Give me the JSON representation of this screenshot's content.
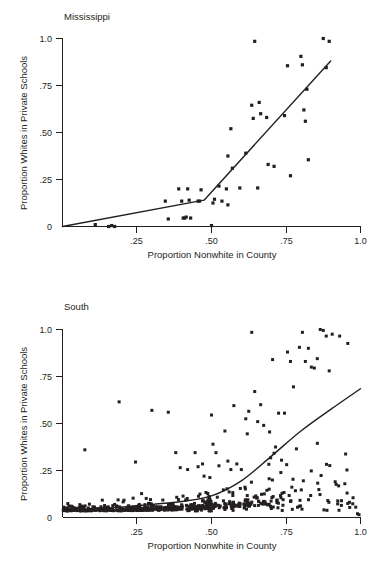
{
  "figure": {
    "panels": [
      {
        "id": "mississippi",
        "title": "Mississippi",
        "xlabel": "Proportion Nonwhite in County",
        "ylabel": "Proportion  Whites in Private Schools",
        "xticklabels": [
          "",
          ".25",
          ".50",
          ".75",
          "1.0"
        ],
        "yticklabels": [
          "0",
          ".25",
          ".50",
          ".75",
          "1.0"
        ]
      },
      {
        "id": "south",
        "title": "South",
        "xlabel": "Proportion Nonwhite in County",
        "ylabel": "Proportion  Whites in Private Schools",
        "xticklabels": [
          "",
          ".25",
          ".50",
          ".75",
          "1.0"
        ],
        "yticklabels": [
          "0",
          ".25",
          ".50",
          ".75",
          "1.0"
        ]
      }
    ]
  },
  "chart_data": [
    {
      "type": "scatter",
      "title": "Mississippi",
      "xlabel": "Proportion Nonwhite in County",
      "ylabel": "Proportion  Whites in Private Schools",
      "xlim": [
        0,
        1.0
      ],
      "ylim": [
        0,
        1.0
      ],
      "xticks": [
        0,
        0.25,
        0.5,
        0.75,
        1.0
      ],
      "yticks": [
        0,
        0.25,
        0.5,
        0.75,
        1.0
      ],
      "xticklabels": [
        "",
        ".25",
        ".50",
        ".75",
        "1.0"
      ],
      "yticklabels": [
        "0",
        ".25",
        ".50",
        ".75",
        "1.0"
      ],
      "grid": false,
      "legend": "none",
      "marker_color": "#231f20",
      "marker_size": 1.6,
      "points": [
        [
          0.11,
          0.01
        ],
        [
          0.155,
          0.0
        ],
        [
          0.165,
          0.005
        ],
        [
          0.175,
          0.0
        ],
        [
          0.345,
          0.135
        ],
        [
          0.355,
          0.04
        ],
        [
          0.39,
          0.2
        ],
        [
          0.4,
          0.135
        ],
        [
          0.405,
          0.045
        ],
        [
          0.41,
          0.045
        ],
        [
          0.415,
          0.05
        ],
        [
          0.42,
          0.2
        ],
        [
          0.425,
          0.14
        ],
        [
          0.43,
          0.045
        ],
        [
          0.455,
          0.135
        ],
        [
          0.46,
          0.135
        ],
        [
          0.465,
          0.195
        ],
        [
          0.5,
          0.005
        ],
        [
          0.505,
          0.125
        ],
        [
          0.51,
          0.145
        ],
        [
          0.525,
          0.215
        ],
        [
          0.535,
          0.135
        ],
        [
          0.55,
          0.2
        ],
        [
          0.555,
          0.375
        ],
        [
          0.555,
          0.115
        ],
        [
          0.565,
          0.52
        ],
        [
          0.57,
          0.31
        ],
        [
          0.595,
          0.205
        ],
        [
          0.615,
          0.39
        ],
        [
          0.635,
          0.645
        ],
        [
          0.64,
          0.575
        ],
        [
          0.645,
          0.985
        ],
        [
          0.655,
          0.205
        ],
        [
          0.66,
          0.66
        ],
        [
          0.665,
          0.6
        ],
        [
          0.685,
          0.58
        ],
        [
          0.69,
          0.33
        ],
        [
          0.71,
          0.32
        ],
        [
          0.745,
          0.59
        ],
        [
          0.755,
          0.855
        ],
        [
          0.765,
          0.27
        ],
        [
          0.8,
          0.905
        ],
        [
          0.805,
          0.86
        ],
        [
          0.81,
          0.62
        ],
        [
          0.815,
          0.56
        ],
        [
          0.82,
          0.73
        ],
        [
          0.825,
          0.355
        ],
        [
          0.875,
          1.0
        ],
        [
          0.885,
          0.845
        ],
        [
          0.895,
          0.985
        ]
      ],
      "fit_line": {
        "kind": "piecewise-linear",
        "vertices": [
          [
            0.0,
            0.0
          ],
          [
            0.475,
            0.14
          ],
          [
            0.9,
            0.88
          ]
        ]
      }
    },
    {
      "type": "scatter",
      "title": "South",
      "xlabel": "Proportion Nonwhite in County",
      "ylabel": "Proportion  Whites in Private Schools",
      "xlim": [
        0,
        1.0
      ],
      "ylim": [
        0,
        1.0
      ],
      "xticks": [
        0,
        0.25,
        0.5,
        0.75,
        1.0
      ],
      "yticks": [
        0,
        0.25,
        0.5,
        0.75,
        1.0
      ],
      "xticklabels": [
        "",
        ".25",
        ".50",
        ".75",
        "1.0"
      ],
      "yticklabels": [
        "0",
        ".25",
        ".50",
        ".75",
        "1.0"
      ],
      "grid": false,
      "legend": "none",
      "marker_color": "#231f20",
      "marker_size": 1.5,
      "n_points": 600,
      "point_seed": 20240517,
      "density_note": "dense band of near-zero values for x<0.5; spread increases with x",
      "points": [
        [
          0.075,
          0.36
        ],
        [
          0.19,
          0.615
        ],
        [
          0.245,
          0.295
        ],
        [
          0.3,
          0.57
        ],
        [
          0.355,
          0.56
        ],
        [
          0.38,
          0.345
        ],
        [
          0.395,
          0.265
        ],
        [
          0.42,
          0.255
        ],
        [
          0.445,
          0.345
        ],
        [
          0.455,
          0.27
        ],
        [
          0.47,
          0.285
        ],
        [
          0.475,
          0.22
        ],
        [
          0.5,
          0.545
        ],
        [
          0.505,
          0.39
        ],
        [
          0.515,
          0.345
        ],
        [
          0.525,
          0.275
        ],
        [
          0.545,
          0.46
        ],
        [
          0.555,
          0.3
        ],
        [
          0.565,
          0.255
        ],
        [
          0.575,
          0.595
        ],
        [
          0.585,
          0.285
        ],
        [
          0.6,
          0.255
        ],
        [
          0.615,
          0.525
        ],
        [
          0.62,
          0.445
        ],
        [
          0.625,
          0.565
        ],
        [
          0.635,
          0.985
        ],
        [
          0.645,
          0.67
        ],
        [
          0.655,
          0.51
        ],
        [
          0.665,
          0.6
        ],
        [
          0.675,
          0.49
        ],
        [
          0.695,
          0.455
        ],
        [
          0.705,
          0.84
        ],
        [
          0.715,
          0.375
        ],
        [
          0.725,
          0.555
        ],
        [
          0.735,
          0.305
        ],
        [
          0.745,
          0.555
        ],
        [
          0.755,
          0.88
        ],
        [
          0.765,
          0.83
        ],
        [
          0.775,
          0.695
        ],
        [
          0.785,
          0.365
        ],
        [
          0.795,
          0.905
        ],
        [
          0.805,
          0.985
        ],
        [
          0.815,
          0.83
        ],
        [
          0.825,
          0.9
        ],
        [
          0.835,
          0.8
        ],
        [
          0.845,
          0.795
        ],
        [
          0.855,
          0.845
        ],
        [
          0.865,
          1.0
        ],
        [
          0.875,
          0.995
        ],
        [
          0.885,
          0.965
        ],
        [
          0.895,
          0.78
        ],
        [
          0.905,
          0.975
        ],
        [
          0.915,
          0.19
        ],
        [
          0.93,
          0.965
        ],
        [
          0.955,
          0.13
        ],
        [
          0.975,
          0.105
        ],
        [
          0.99,
          0.02
        ],
        [
          0.995,
          0.015
        ]
      ],
      "fit_line": {
        "kind": "smooth-curve",
        "vertices": [
          [
            0.0,
            0.035
          ],
          [
            0.1,
            0.045
          ],
          [
            0.2,
            0.055
          ],
          [
            0.3,
            0.07
          ],
          [
            0.4,
            0.085
          ],
          [
            0.5,
            0.115
          ],
          [
            0.6,
            0.195
          ],
          [
            0.7,
            0.325
          ],
          [
            0.8,
            0.46
          ],
          [
            0.9,
            0.575
          ],
          [
            1.0,
            0.685
          ]
        ]
      }
    }
  ]
}
